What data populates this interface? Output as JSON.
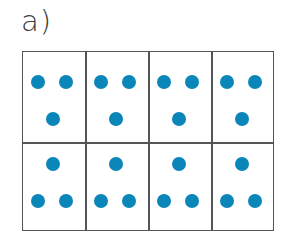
{
  "label": "a)",
  "dot_color": "#0a86b8",
  "grid": {
    "rows": 2,
    "cols": 4,
    "cells": [
      {
        "row": 0,
        "col": 0,
        "pattern": "two-top-one-bottom",
        "dots": 3
      },
      {
        "row": 0,
        "col": 1,
        "pattern": "two-top-one-bottom",
        "dots": 3
      },
      {
        "row": 0,
        "col": 2,
        "pattern": "two-top-one-bottom",
        "dots": 3
      },
      {
        "row": 0,
        "col": 3,
        "pattern": "two-top-one-bottom",
        "dots": 3
      },
      {
        "row": 1,
        "col": 0,
        "pattern": "one-top-two-bottom",
        "dots": 3
      },
      {
        "row": 1,
        "col": 1,
        "pattern": "one-top-two-bottom",
        "dots": 3
      },
      {
        "row": 1,
        "col": 2,
        "pattern": "one-top-two-bottom",
        "dots": 3
      },
      {
        "row": 1,
        "col": 3,
        "pattern": "one-top-two-bottom",
        "dots": 3
      }
    ]
  }
}
